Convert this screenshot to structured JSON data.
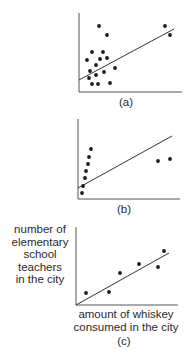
{
  "chart_data": [
    {
      "type": "scatter",
      "caption": "(a)",
      "title": "",
      "xlabel": "",
      "ylabel": "",
      "grid": false,
      "points": [
        [
          99,
          26
        ],
        [
          107,
          35
        ],
        [
          165,
          26
        ],
        [
          170,
          35
        ],
        [
          92,
          52
        ],
        [
          103,
          52
        ],
        [
          87,
          60
        ],
        [
          100,
          59
        ],
        [
          107,
          58
        ],
        [
          96,
          65
        ],
        [
          115,
          68
        ],
        [
          90,
          71
        ],
        [
          104,
          72
        ],
        [
          89,
          78
        ],
        [
          96,
          75
        ],
        [
          92,
          84
        ],
        [
          98,
          84
        ],
        [
          110,
          83
        ]
      ],
      "fit_line": [
        [
          79,
          80
        ],
        [
          174,
          29
        ]
      ],
      "axes": {
        "origin": [
          79,
          92
        ],
        "x_end": 182,
        "y_top": 13
      }
    },
    {
      "type": "scatter",
      "caption": "(b)",
      "title": "",
      "xlabel": "",
      "ylabel": "",
      "grid": false,
      "points": [
        [
          91,
          149
        ],
        [
          89,
          157
        ],
        [
          88,
          164
        ],
        [
          86,
          171
        ],
        [
          85,
          178
        ],
        [
          83,
          186
        ],
        [
          82,
          193
        ],
        [
          158,
          161
        ],
        [
          170,
          159
        ]
      ],
      "fit_line": [
        [
          78,
          188
        ],
        [
          172,
          136
        ]
      ],
      "axes": {
        "origin": [
          78,
          199
        ],
        "x_end": 180,
        "y_top": 119
      }
    },
    {
      "type": "scatter",
      "caption": "(c)",
      "title": "",
      "xlabel": "amount of whiskey consumed in the city",
      "ylabel": "number of elementary school teachers in the city",
      "grid": false,
      "points": [
        [
          86,
          293
        ],
        [
          109,
          292
        ],
        [
          120,
          273
        ],
        [
          139,
          264
        ],
        [
          158,
          267
        ],
        [
          164,
          251
        ]
      ],
      "fit_line": [
        [
          76,
          305
        ],
        [
          169,
          253
        ]
      ],
      "axes": {
        "origin": [
          76,
          305
        ],
        "x_end": 178,
        "y_top": 227
      }
    }
  ],
  "labels": {
    "a": "(a)",
    "b": "(b)",
    "c": "(c)",
    "c_ylabel_lines": [
      "number of",
      "elementary",
      "school",
      "teachers",
      "in the city"
    ],
    "c_xlabel_lines": [
      "amount of whiskey",
      "consumed in the city"
    ]
  },
  "colors": {
    "ink": "#1a1a1a",
    "axis": "#555555",
    "line": "#333333"
  }
}
